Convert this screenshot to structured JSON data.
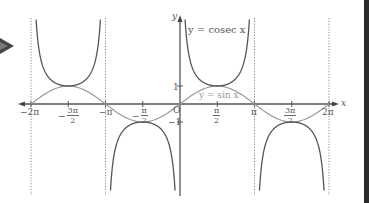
{
  "diagram": {
    "curves": [
      {
        "name": "cosec",
        "label": "y = cosec x",
        "color": "#555555"
      },
      {
        "name": "sin",
        "label": "y = sin x",
        "color": "#9a9a9a"
      }
    ],
    "axes": {
      "x_label": "x",
      "y_label": "y",
      "origin_label": "O",
      "x_ticks": [
        {
          "value": "-2π",
          "text": "−2π"
        },
        {
          "value": "-3π/2",
          "sign": "−",
          "num": "3π",
          "den": "2"
        },
        {
          "value": "-π",
          "text": "−π"
        },
        {
          "value": "-π/2",
          "sign": "−",
          "num": "π",
          "den": "2"
        },
        {
          "value": "π/2",
          "num": "π",
          "den": "2"
        },
        {
          "value": "π",
          "text": "π"
        },
        {
          "value": "3π/2",
          "num": "3π",
          "den": "2"
        },
        {
          "value": "2π",
          "text": "2π"
        }
      ],
      "y_ticks": [
        {
          "value": 1,
          "text": "1"
        },
        {
          "value": -1,
          "text": "−1"
        }
      ]
    },
    "asymptotes": [
      "-2π",
      "-π",
      "π",
      "2π"
    ]
  },
  "chart_data": {
    "type": "line",
    "title": "",
    "xlabel": "x",
    "ylabel": "y",
    "xlim": [
      -6.2832,
      6.2832
    ],
    "ylim": [
      -4.8,
      4.8
    ],
    "x_tick_labels": [
      "−2π",
      "−3π/2",
      "−π",
      "−π/2",
      "π/2",
      "π",
      "3π/2",
      "2π"
    ],
    "y_tick_labels": [
      "1",
      "−1"
    ],
    "series": [
      {
        "name": "y = cosec x",
        "function": "1/sin(x)",
        "asymptotes": [
          -6.2832,
          -3.1416,
          0,
          3.1416,
          6.2832
        ],
        "turning_points": [
          [
            -4.7124,
            1
          ],
          [
            -1.5708,
            -1
          ],
          [
            1.5708,
            1
          ],
          [
            4.7124,
            -1
          ]
        ]
      },
      {
        "name": "y = sin x",
        "function": "sin(x)",
        "zeros": [
          -6.2832,
          -3.1416,
          0,
          3.1416,
          6.2832
        ],
        "turning_points": [
          [
            -4.7124,
            1
          ],
          [
            -1.5708,
            -1
          ],
          [
            1.5708,
            1
          ],
          [
            4.7124,
            -1
          ]
        ]
      }
    ],
    "grid": false,
    "legend": "inline labels"
  }
}
